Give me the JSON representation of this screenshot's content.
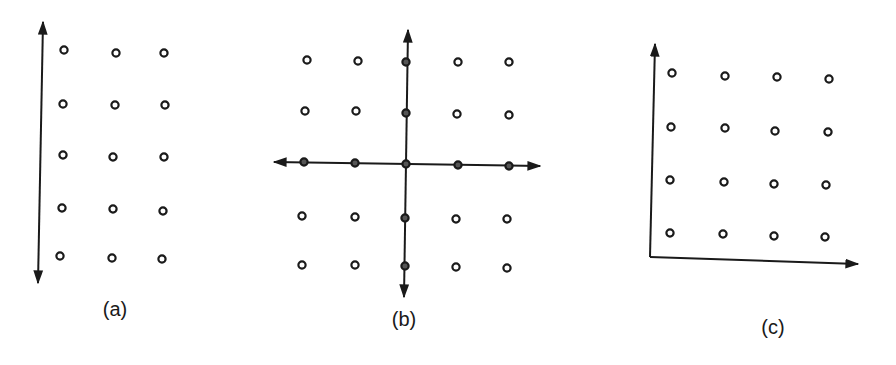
{
  "figure": {
    "panels": [
      {
        "id": "a",
        "label": "(a)",
        "label_pos": [
          115,
          298
        ],
        "grid": {
          "rows": 5,
          "cols": 3
        },
        "points": [
          [
            64,
            50
          ],
          [
            116,
            53
          ],
          [
            164,
            53
          ],
          [
            63,
            104
          ],
          [
            115,
            105
          ],
          [
            165,
            105
          ],
          [
            63,
            155
          ],
          [
            113,
            157
          ],
          [
            164,
            157
          ],
          [
            62,
            208
          ],
          [
            113,
            209
          ],
          [
            163,
            211
          ],
          [
            60,
            256
          ],
          [
            112,
            258
          ],
          [
            162,
            259
          ]
        ],
        "axes": [
          {
            "type": "double-arrow",
            "from": [
              43,
              22
            ],
            "to": [
              38,
              283
            ],
            "name": "vertical-axis"
          }
        ]
      },
      {
        "id": "b",
        "label": "(b)",
        "label_pos": [
          404,
          308
        ],
        "grid": {
          "rows": 5,
          "cols": 5
        },
        "points": [
          [
            307,
            60
          ],
          [
            358,
            61
          ],
          [
            406,
            62
          ],
          [
            458,
            62
          ],
          [
            509,
            62
          ],
          [
            305,
            111
          ],
          [
            356,
            111
          ],
          [
            406,
            113
          ],
          [
            457,
            114
          ],
          [
            509,
            115
          ],
          [
            304,
            162
          ],
          [
            355,
            163
          ],
          [
            406,
            164
          ],
          [
            458,
            165
          ],
          [
            509,
            166
          ],
          [
            302,
            216
          ],
          [
            355,
            217
          ],
          [
            405,
            218
          ],
          [
            456,
            219
          ],
          [
            507,
            219
          ],
          [
            302,
            265
          ],
          [
            355,
            265
          ],
          [
            405,
            266
          ],
          [
            456,
            267
          ],
          [
            507,
            268
          ]
        ],
        "axis_points": [
          [
            406,
            62
          ],
          [
            406,
            113
          ],
          [
            304,
            162
          ],
          [
            355,
            163
          ],
          [
            406,
            164
          ],
          [
            458,
            165
          ],
          [
            509,
            166
          ],
          [
            405,
            218
          ],
          [
            405,
            266
          ]
        ],
        "axes": [
          {
            "type": "double-arrow",
            "from": [
              274,
              162
            ],
            "to": [
              540,
              166
            ],
            "name": "horizontal-axis"
          },
          {
            "type": "double-arrow",
            "from": [
              408,
              30
            ],
            "to": [
              404,
              297
            ],
            "name": "vertical-axis"
          }
        ]
      },
      {
        "id": "c",
        "label": "(c)",
        "label_pos": [
          773,
          316
        ],
        "grid": {
          "rows": 4,
          "cols": 4
        },
        "points": [
          [
            672,
            73
          ],
          [
            725,
            76
          ],
          [
            777,
            77
          ],
          [
            829,
            79
          ],
          [
            671,
            127
          ],
          [
            725,
            128
          ],
          [
            775,
            131
          ],
          [
            828,
            132
          ],
          [
            670,
            180
          ],
          [
            724,
            182
          ],
          [
            774,
            184
          ],
          [
            826,
            185
          ],
          [
            670,
            233
          ],
          [
            723,
            234
          ],
          [
            774,
            236
          ],
          [
            825,
            237
          ]
        ],
        "axes": [
          {
            "type": "single-arrow",
            "from": [
              650,
              257
            ],
            "to": [
              655,
              44
            ],
            "name": "vertical-axis"
          },
          {
            "type": "single-arrow",
            "from": [
              650,
              257
            ],
            "to": [
              858,
              264
            ],
            "name": "horizontal-axis"
          }
        ]
      }
    ]
  }
}
